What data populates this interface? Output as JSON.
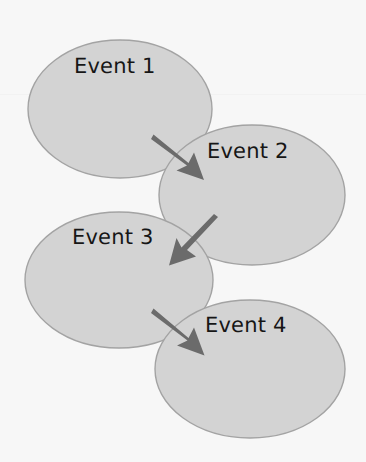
{
  "diagram": {
    "type": "flow-diagram",
    "background_color": "#f7f7f7",
    "node_fill_color": "#d3d3d3",
    "node_stroke_color": "#a3a3a3",
    "arrow_color": "#6b6b6b",
    "label_color": "#161616",
    "nodes": [
      {
        "id": "event-1",
        "label": "Event 1",
        "shape": "ellipse",
        "cx": 120,
        "cy": 109,
        "rx": 92,
        "ry": 69,
        "label_x": 74,
        "label_y": 56
      },
      {
        "id": "event-2",
        "label": "Event 2",
        "shape": "ellipse",
        "cx": 252,
        "cy": 195,
        "rx": 93,
        "ry": 70,
        "label_x": 207,
        "label_y": 141
      },
      {
        "id": "event-3",
        "label": "Event 3",
        "shape": "ellipse",
        "cx": 119,
        "cy": 280,
        "rx": 94,
        "ry": 68,
        "label_x": 72,
        "label_y": 227
      },
      {
        "id": "event-4",
        "label": "Event 4",
        "shape": "ellipse",
        "cx": 250,
        "cy": 369,
        "rx": 95,
        "ry": 69,
        "label_x": 205,
        "label_y": 315
      }
    ],
    "edges": [
      {
        "id": "edge-1-2",
        "from": "event-1",
        "to": "event-2",
        "direction": "down-right",
        "x1": 154,
        "y1": 137,
        "x2": 202,
        "y2": 177
      },
      {
        "id": "edge-2-3",
        "from": "event-2",
        "to": "event-3",
        "direction": "down-left",
        "x1": 216,
        "y1": 219,
        "x2": 172,
        "y2": 263
      },
      {
        "id": "edge-3-4",
        "from": "event-3",
        "to": "event-4",
        "direction": "down-right",
        "x1": 154,
        "y1": 311,
        "x2": 202,
        "y2": 352
      }
    ]
  }
}
